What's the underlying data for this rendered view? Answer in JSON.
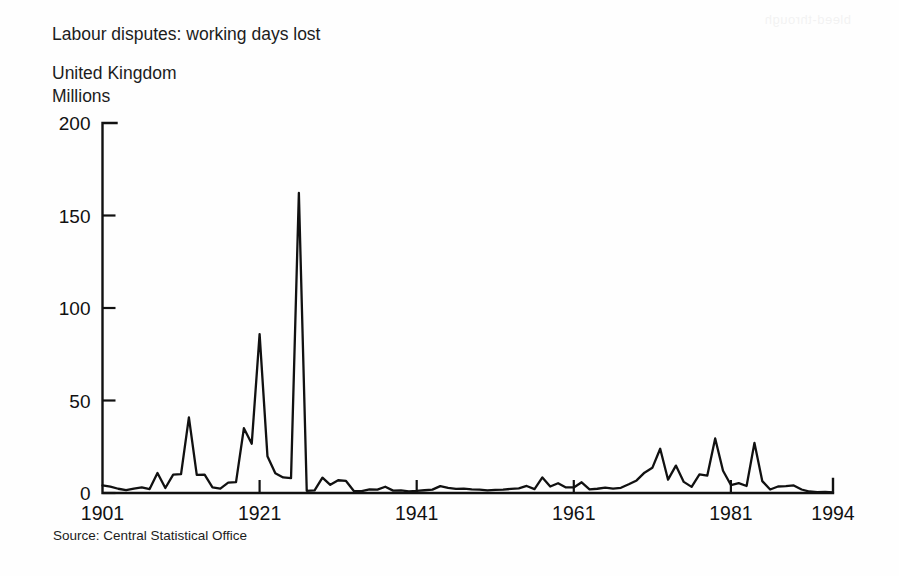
{
  "header": {
    "title": "Labour disputes: working days lost",
    "region": "United Kingdom",
    "units": "Millions"
  },
  "footer": {
    "source": "Source: Central Statistical Office"
  },
  "artifact": {
    "bleed_text": "bleed-through"
  },
  "chart_data": {
    "type": "line",
    "title": "Labour disputes: working days lost",
    "subtitle": "United Kingdom",
    "xlabel": "",
    "ylabel": "Millions",
    "ylim": [
      0,
      200
    ],
    "xlim": [
      1901,
      1994
    ],
    "grid": false,
    "legend": false,
    "yticks": [
      0,
      50,
      100,
      150,
      200
    ],
    "ytick_labels": [
      "0",
      "50",
      "100",
      "150",
      "200"
    ],
    "xticks": [
      1901,
      1921,
      1941,
      1961,
      1981,
      1994
    ],
    "xtick_labels": [
      "1901",
      "1921",
      "1941",
      "1961",
      "1981",
      "1994"
    ],
    "line_color": "#111111",
    "series": [
      {
        "name": "Working days lost (millions)",
        "x": [
          1901,
          1902,
          1903,
          1904,
          1905,
          1906,
          1907,
          1908,
          1909,
          1910,
          1911,
          1912,
          1913,
          1914,
          1915,
          1916,
          1917,
          1918,
          1919,
          1920,
          1921,
          1922,
          1923,
          1924,
          1925,
          1926,
          1927,
          1928,
          1929,
          1930,
          1931,
          1932,
          1933,
          1934,
          1935,
          1936,
          1937,
          1938,
          1939,
          1940,
          1941,
          1942,
          1943,
          1944,
          1945,
          1946,
          1947,
          1948,
          1949,
          1950,
          1951,
          1952,
          1953,
          1954,
          1955,
          1956,
          1957,
          1958,
          1959,
          1960,
          1961,
          1962,
          1963,
          1964,
          1965,
          1966,
          1967,
          1968,
          1969,
          1970,
          1971,
          1972,
          1973,
          1974,
          1975,
          1976,
          1977,
          1978,
          1979,
          1980,
          1981,
          1982,
          1983,
          1984,
          1985,
          1986,
          1987,
          1988,
          1989,
          1990,
          1991,
          1992,
          1993,
          1994
        ],
        "values": [
          4.1,
          3.4,
          2.3,
          1.5,
          2.4,
          3.0,
          2.1,
          10.8,
          2.7,
          9.9,
          10.2,
          40.9,
          9.8,
          9.9,
          3.0,
          2.4,
          5.6,
          5.9,
          35.0,
          26.6,
          85.9,
          19.9,
          10.7,
          8.4,
          8.0,
          162.2,
          1.2,
          1.4,
          8.3,
          4.4,
          6.9,
          6.5,
          1.1,
          1.0,
          2.0,
          1.8,
          3.4,
          1.3,
          1.4,
          0.9,
          1.1,
          1.5,
          1.8,
          3.7,
          2.8,
          2.2,
          2.4,
          2.0,
          1.8,
          1.4,
          1.7,
          1.8,
          2.2,
          2.5,
          3.8,
          2.1,
          8.4,
          3.5,
          5.3,
          3.0,
          3.0,
          5.8,
          2.0,
          2.3,
          2.9,
          2.4,
          2.8,
          4.7,
          6.8,
          11.0,
          13.6,
          23.9,
          7.2,
          14.8,
          6.0,
          3.3,
          10.1,
          9.4,
          29.5,
          12.0,
          4.3,
          5.3,
          3.8,
          27.1,
          6.4,
          1.9,
          3.5,
          3.7,
          4.1,
          1.9,
          0.8,
          0.5,
          0.6,
          0.3
        ]
      }
    ]
  }
}
